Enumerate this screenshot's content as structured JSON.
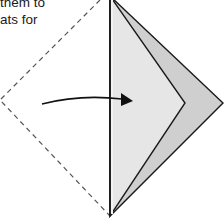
{
  "caption": {
    "lines": [
      "them to",
      "ats for"
    ]
  },
  "diagram": {
    "type": "origami-fold-step",
    "colors": {
      "paper_front": "#e6e6e6",
      "paper_back": "#cfcfcf",
      "outline": "#1a1a1a",
      "dashed_outline": "#555555",
      "arrow": "#111111"
    },
    "elements": [
      "dashed-left-half-outline",
      "center-vertical-fold-edge",
      "folded-flap-front",
      "folded-flap-back-layer",
      "fold-direction-arrow"
    ]
  }
}
